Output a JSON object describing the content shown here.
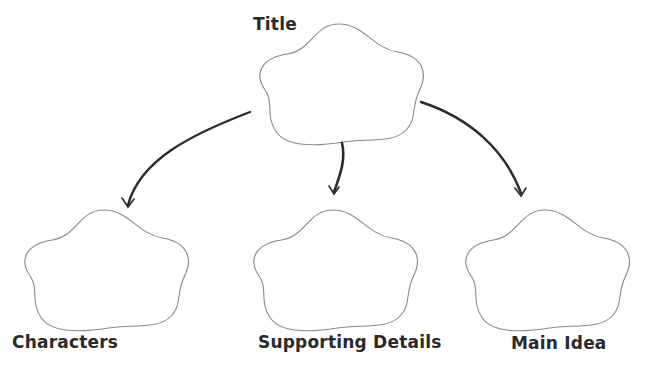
{
  "diagram": {
    "type": "graphic-organizer",
    "nodes": [
      {
        "id": "title",
        "label": "Title",
        "shape": "cloud"
      },
      {
        "id": "characters",
        "label": "Characters",
        "shape": "cloud"
      },
      {
        "id": "supporting",
        "label": "Supporting Details",
        "shape": "cloud"
      },
      {
        "id": "main",
        "label": "Main Idea",
        "shape": "cloud"
      }
    ],
    "edges": [
      {
        "from": "title",
        "to": "characters"
      },
      {
        "from": "title",
        "to": "supporting"
      },
      {
        "from": "title",
        "to": "main"
      }
    ],
    "colors": {
      "outline": "#8a8a8a",
      "arrow": "#2a2a2a",
      "text": "#2a2a2a"
    }
  }
}
